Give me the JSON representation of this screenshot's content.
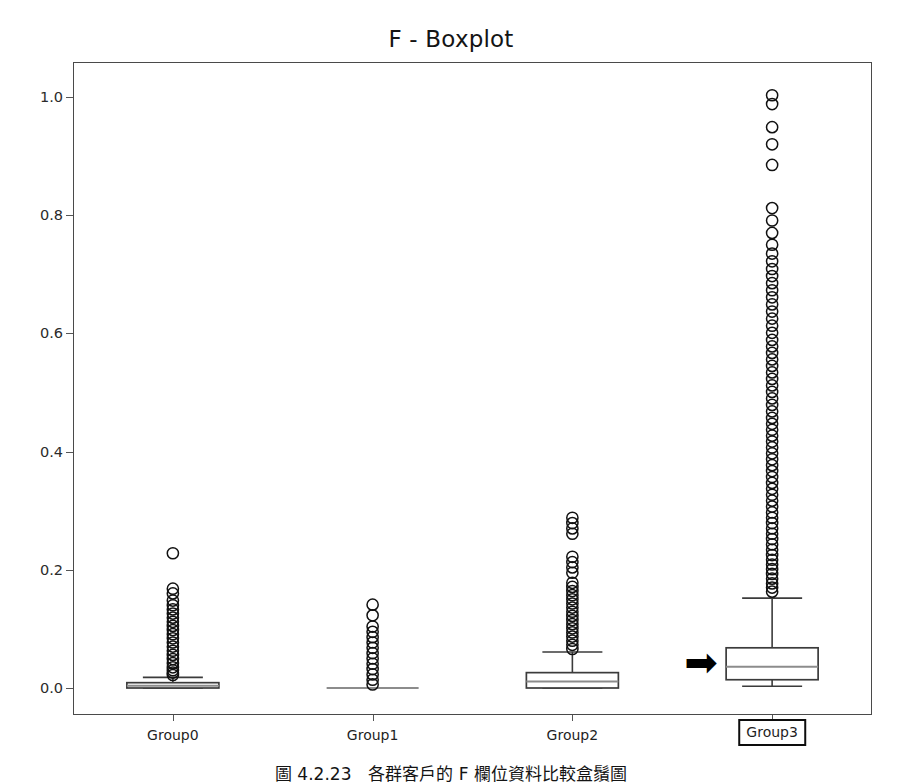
{
  "figure": {
    "title": "F - Boxplot",
    "caption": "圖 4.2.23　各群客戶的 F 欄位資料比較盒鬚圖",
    "annotation_arrow": "➡",
    "highlighted_group": "Group3"
  },
  "axes": {
    "ylabel": "",
    "xlabel": "",
    "ytick_labels": [
      "0.0",
      "0.2",
      "0.4",
      "0.6",
      "0.8",
      "1.0"
    ],
    "xtick_labels": [
      "Group0",
      "Group1",
      "Group2",
      "Group3"
    ]
  },
  "chart_data": {
    "type": "box",
    "title": "F - Boxplot",
    "xlabel": "",
    "ylabel": "",
    "ylim": [
      -0.045,
      1.055
    ],
    "yticks": [
      0.0,
      0.2,
      0.4,
      0.6,
      0.8,
      1.0
    ],
    "grid": false,
    "legend": "none",
    "categories": [
      "Group0",
      "Group1",
      "Group2",
      "Group3"
    ],
    "boxes": [
      {
        "name": "Group0",
        "whisker_low": 0.0,
        "q1": 0.0,
        "median": 0.004,
        "q3": 0.009,
        "whisker_high": 0.018,
        "outliers": [
          0.228,
          0.168,
          0.16,
          0.148,
          0.14,
          0.133,
          0.126,
          0.119,
          0.112,
          0.105,
          0.098,
          0.091,
          0.084,
          0.077,
          0.07,
          0.063,
          0.056,
          0.049,
          0.042,
          0.035,
          0.03,
          0.026,
          0.022
        ]
      },
      {
        "name": "Group1",
        "whisker_low": 0.0,
        "q1": 0.0,
        "median": 0.0,
        "q3": 0.0,
        "whisker_high": 0.0,
        "outliers": [
          0.141,
          0.123,
          0.104,
          0.095,
          0.086,
          0.077,
          0.068,
          0.059,
          0.05,
          0.041,
          0.032,
          0.023,
          0.014,
          0.006
        ]
      },
      {
        "name": "Group2",
        "whisker_low": 0.0,
        "q1": 0.0,
        "median": 0.011,
        "q3": 0.026,
        "whisker_high": 0.061,
        "outliers": [
          0.288,
          0.279,
          0.27,
          0.261,
          0.222,
          0.213,
          0.204,
          0.195,
          0.178,
          0.171,
          0.164,
          0.157,
          0.15,
          0.143,
          0.136,
          0.129,
          0.122,
          0.115,
          0.108,
          0.101,
          0.094,
          0.087,
          0.08,
          0.073,
          0.066
        ]
      },
      {
        "name": "Group3",
        "whisker_low": 0.003,
        "q1": 0.014,
        "median": 0.036,
        "q3": 0.068,
        "whisker_high": 0.152,
        "outliers": [
          1.003,
          0.988,
          0.949,
          0.92,
          0.885,
          0.812,
          0.791,
          0.77,
          0.75,
          0.735,
          0.722,
          0.709,
          0.697,
          0.685,
          0.673,
          0.661,
          0.649,
          0.637,
          0.625,
          0.613,
          0.601,
          0.589,
          0.578,
          0.567,
          0.556,
          0.545,
          0.534,
          0.523,
          0.512,
          0.501,
          0.49,
          0.479,
          0.468,
          0.457,
          0.447,
          0.437,
          0.427,
          0.417,
          0.407,
          0.397,
          0.387,
          0.377,
          0.367,
          0.357,
          0.347,
          0.337,
          0.327,
          0.317,
          0.307,
          0.297,
          0.288,
          0.279,
          0.27,
          0.261,
          0.252,
          0.243,
          0.234,
          0.225,
          0.217,
          0.209,
          0.201,
          0.193,
          0.185,
          0.177,
          0.17,
          0.163
        ]
      }
    ],
    "style": {
      "box_edge_color": "#3b3b3b",
      "box_face_color": "#ffffff",
      "median_color": "#8c8c8c",
      "whisker_color": "#3b3b3b",
      "flier_edge_color": "#111111",
      "frame_color": "#4a4a4a"
    }
  }
}
